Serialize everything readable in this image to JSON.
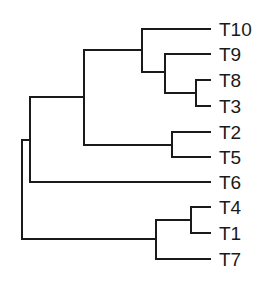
{
  "diagram": {
    "type": "dendrogram",
    "orientation": "left-to-right",
    "line_color": "#1a1a1a",
    "background": "#ffffff",
    "leaves": [
      {
        "label": "T10",
        "y": 29
      },
      {
        "label": "T9",
        "y": 54
      },
      {
        "label": "T8",
        "y": 80
      },
      {
        "label": "T3",
        "y": 106
      },
      {
        "label": "T2",
        "y": 132
      },
      {
        "label": "T5",
        "y": 157
      },
      {
        "label": "T6",
        "y": 182
      },
      {
        "label": "T4",
        "y": 207
      },
      {
        "label": "T1",
        "y": 233
      },
      {
        "label": "T7",
        "y": 259
      }
    ],
    "newick": "((((T10,(T9,(T8,T3))),(T2,T5)),T6),((T4,T1),T7));"
  }
}
